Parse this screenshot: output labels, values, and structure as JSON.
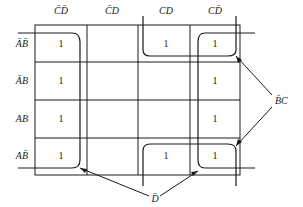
{
  "diagram": {
    "type": "karnaugh-map",
    "column_headers": [
      "C̄D̄",
      "C̄D",
      "CD",
      "CD̄"
    ],
    "row_headers": [
      "ĀB̄",
      "ĀB",
      "AB",
      "AB̄"
    ],
    "cells": [
      [
        "1",
        "",
        "1",
        "1"
      ],
      [
        "1",
        "",
        "",
        "1"
      ],
      [
        "1",
        "",
        "",
        "1"
      ],
      [
        "1",
        "",
        "1",
        "1"
      ]
    ],
    "groups": [
      {
        "label": "D̄",
        "description": "Columns C̄D̄ and CD̄ (wrap-around)"
      },
      {
        "label": "B̄C",
        "description": "Rows ĀB̄ and AB̄, columns CD and CD̄ (corner wrap)"
      }
    ],
    "annotations": {
      "dbar": "D̄",
      "bbar_c": "B̄C"
    }
  }
}
